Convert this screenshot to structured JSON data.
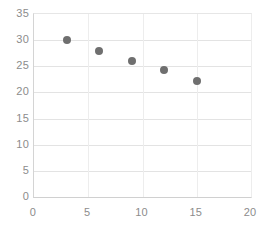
{
  "chart_data": {
    "type": "scatter",
    "title": "",
    "subtitle": "",
    "xlabel": "",
    "ylabel": "",
    "xlim": [
      0,
      20
    ],
    "ylim": [
      0,
      35
    ],
    "xticks": [
      0,
      5,
      10,
      15,
      20
    ],
    "yticks": [
      0,
      5,
      10,
      15,
      20,
      25,
      30,
      35
    ],
    "grid": true,
    "legend": false,
    "legend_position": "none",
    "marker": {
      "shape": "circle",
      "color": "#6f6f6f",
      "size_px": 8
    },
    "series": [
      {
        "name": "",
        "x": [
          3,
          6,
          9,
          12,
          15
        ],
        "y": [
          30,
          28,
          26,
          24.2,
          22.2
        ],
        "points": [
          {
            "x": 3,
            "y": 30
          },
          {
            "x": 6,
            "y": 28
          },
          {
            "x": 9,
            "y": 26
          },
          {
            "x": 12,
            "y": 24.2
          },
          {
            "x": 15,
            "y": 22.2
          }
        ]
      }
    ]
  },
  "axis_colors": {
    "tick_label": "#8c8c8c",
    "gridline": "#e3e3e3",
    "axis_line": "#d4d4d4"
  }
}
